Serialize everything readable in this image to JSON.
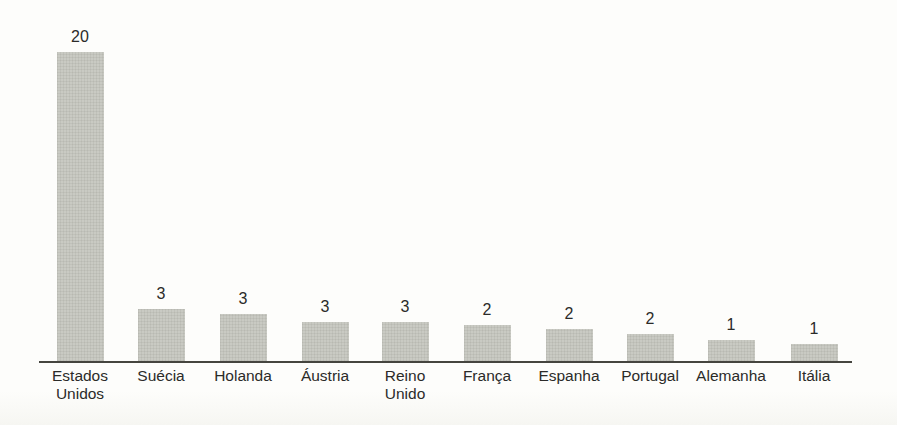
{
  "chart_data": {
    "type": "bar",
    "title": "",
    "xlabel": "",
    "ylabel": "",
    "categories": [
      "Estados Unidos",
      "Suécia",
      "Holanda",
      "Áustria",
      "Reino Unido",
      "França",
      "Espanha",
      "Portugal",
      "Alemanha",
      "Itália"
    ],
    "values": [
      20,
      3,
      3,
      3,
      3,
      2,
      2,
      2,
      1,
      1
    ],
    "data_labels": [
      "20",
      "3",
      "3",
      "3",
      "3",
      "2",
      "2",
      "2",
      "1",
      "1"
    ],
    "tick_label_lines": [
      [
        "Estados",
        "Unidos"
      ],
      [
        "Suécia"
      ],
      [
        "Holanda"
      ],
      [
        "Áustria"
      ],
      [
        "Reino",
        "Unido"
      ],
      [
        "França"
      ],
      [
        "Espanha"
      ],
      [
        "Portugal"
      ],
      [
        "Alemanha"
      ],
      [
        "Itália"
      ]
    ],
    "ylim": [
      0,
      20
    ],
    "grid": false,
    "legend": false,
    "layout_hints": {
      "bar_centers_px": [
        80,
        161,
        243,
        325,
        405,
        487,
        569,
        650,
        731,
        814
      ],
      "bar_heights_px": [
        309,
        52,
        47,
        39,
        39,
        36,
        32,
        27,
        21,
        17
      ],
      "bar_width_px": 47,
      "axis_y_px": 361,
      "axis_x_start_px": 39,
      "axis_x_end_px": 852,
      "value_label_gap_px": 25,
      "tick_label_top_offset_px": 6
    },
    "colors": {
      "bar_fill": "#c9cac3",
      "axis_line": "#45453f",
      "text": "#2b2b29",
      "background": "#fdfdfb"
    }
  }
}
